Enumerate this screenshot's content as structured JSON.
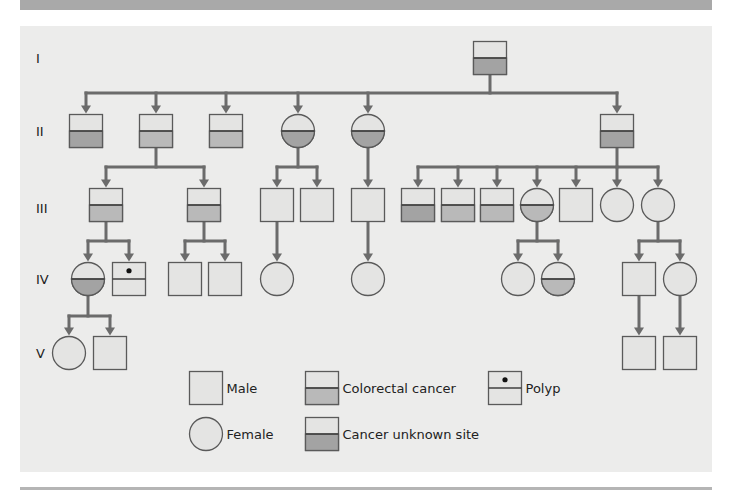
{
  "colors": {
    "background": "#ececeb",
    "node_fill": "#e4e4e3",
    "stroke": "#5a5a5a",
    "connector": "#6b6b6b",
    "colorectal_fill": "#b9b9b9",
    "unknown_site_fill": "#a3a3a3",
    "top_bar": "#a9a9a9"
  },
  "generations": [
    {
      "label": "I",
      "y": 58
    },
    {
      "label": "II",
      "y": 131
    },
    {
      "label": "III",
      "y": 208
    },
    {
      "label": "IV",
      "y": 279
    },
    {
      "label": "V",
      "y": 353
    }
  ],
  "nodes": [
    {
      "id": "g1-1",
      "gen": "I",
      "sex": "male",
      "status": "unknown_site",
      "cx": 490,
      "cy": 58
    },
    {
      "id": "g2-1",
      "gen": "II",
      "sex": "male",
      "status": "unknown_site",
      "cx": 86,
      "cy": 131
    },
    {
      "id": "g2-2",
      "gen": "II",
      "sex": "male",
      "status": "colorectal",
      "cx": 156,
      "cy": 131
    },
    {
      "id": "g2-3",
      "gen": "II",
      "sex": "male",
      "status": "colorectal",
      "cx": 226,
      "cy": 131
    },
    {
      "id": "g2-4",
      "gen": "II",
      "sex": "female",
      "status": "unknown_site",
      "cx": 298,
      "cy": 131
    },
    {
      "id": "g2-5",
      "gen": "II",
      "sex": "female",
      "status": "unknown_site",
      "cx": 368,
      "cy": 131
    },
    {
      "id": "g2-6",
      "gen": "II",
      "sex": "male",
      "status": "unknown_site",
      "cx": 617,
      "cy": 131
    },
    {
      "id": "g3-1",
      "gen": "III",
      "sex": "male",
      "status": "colorectal",
      "cx": 106,
      "cy": 205
    },
    {
      "id": "g3-2",
      "gen": "III",
      "sex": "male",
      "status": "colorectal",
      "cx": 204,
      "cy": 205
    },
    {
      "id": "g3-3",
      "gen": "III",
      "sex": "male",
      "status": "unaffected",
      "cx": 277,
      "cy": 205
    },
    {
      "id": "g3-4",
      "gen": "III",
      "sex": "male",
      "status": "unaffected",
      "cx": 317,
      "cy": 205
    },
    {
      "id": "g3-5",
      "gen": "III",
      "sex": "male",
      "status": "unaffected",
      "cx": 368,
      "cy": 205
    },
    {
      "id": "g3-6",
      "gen": "III",
      "sex": "male",
      "status": "unknown_site",
      "cx": 418,
      "cy": 205
    },
    {
      "id": "g3-7",
      "gen": "III",
      "sex": "male",
      "status": "colorectal",
      "cx": 458,
      "cy": 205
    },
    {
      "id": "g3-8",
      "gen": "III",
      "sex": "male",
      "status": "colorectal",
      "cx": 497,
      "cy": 205
    },
    {
      "id": "g3-9",
      "gen": "III",
      "sex": "female",
      "status": "colorectal",
      "cx": 537,
      "cy": 205
    },
    {
      "id": "g3-10",
      "gen": "III",
      "sex": "male",
      "status": "unaffected",
      "cx": 576,
      "cy": 205
    },
    {
      "id": "g3-11",
      "gen": "III",
      "sex": "female",
      "status": "unaffected",
      "cx": 617,
      "cy": 205
    },
    {
      "id": "g3-12",
      "gen": "III",
      "sex": "female",
      "status": "unaffected",
      "cx": 658,
      "cy": 205
    },
    {
      "id": "g4-1",
      "gen": "IV",
      "sex": "female",
      "status": "unknown_site",
      "cx": 88,
      "cy": 279
    },
    {
      "id": "g4-2",
      "gen": "IV",
      "sex": "male",
      "status": "polyp",
      "cx": 129,
      "cy": 279
    },
    {
      "id": "g4-3",
      "gen": "IV",
      "sex": "male",
      "status": "unaffected",
      "cx": 185,
      "cy": 279
    },
    {
      "id": "g4-4",
      "gen": "IV",
      "sex": "male",
      "status": "unaffected",
      "cx": 225,
      "cy": 279
    },
    {
      "id": "g4-5",
      "gen": "IV",
      "sex": "female",
      "status": "unaffected",
      "cx": 277,
      "cy": 279
    },
    {
      "id": "g4-6",
      "gen": "IV",
      "sex": "female",
      "status": "unaffected",
      "cx": 368,
      "cy": 279
    },
    {
      "id": "g4-7",
      "gen": "IV",
      "sex": "female",
      "status": "unaffected",
      "cx": 518,
      "cy": 279
    },
    {
      "id": "g4-8",
      "gen": "IV",
      "sex": "female",
      "status": "colorectal",
      "cx": 558,
      "cy": 279
    },
    {
      "id": "g4-9",
      "gen": "IV",
      "sex": "male",
      "status": "unaffected",
      "cx": 639,
      "cy": 279
    },
    {
      "id": "g4-10",
      "gen": "IV",
      "sex": "female",
      "status": "unaffected",
      "cx": 680,
      "cy": 279
    },
    {
      "id": "g5-1",
      "gen": "V",
      "sex": "female",
      "status": "unaffected",
      "cx": 69,
      "cy": 353
    },
    {
      "id": "g5-2",
      "gen": "V",
      "sex": "male",
      "status": "unaffected",
      "cx": 110,
      "cy": 353
    },
    {
      "id": "g5-3",
      "gen": "V",
      "sex": "male",
      "status": "unaffected",
      "cx": 639,
      "cy": 353
    },
    {
      "id": "g5-4",
      "gen": "V",
      "sex": "male",
      "status": "unaffected",
      "cx": 680,
      "cy": 353
    }
  ],
  "sibships": [
    {
      "parent": "g1-1",
      "bar_y": 93,
      "children": [
        "g2-1",
        "g2-2",
        "g2-3",
        "g2-4",
        "g2-5",
        "g2-6"
      ]
    },
    {
      "parent": "g2-2",
      "bar_y": 167,
      "children": [
        "g3-1",
        "g3-2"
      ]
    },
    {
      "parent": "g2-4",
      "bar_y": 167,
      "children": [
        "g3-3",
        "g3-4"
      ]
    },
    {
      "parent": "g2-5",
      "bar_y": null,
      "children": [
        "g3-5"
      ]
    },
    {
      "parent": "g2-6",
      "bar_y": 167,
      "children": [
        "g3-6",
        "g3-7",
        "g3-8",
        "g3-9",
        "g3-10",
        "g3-11",
        "g3-12"
      ]
    },
    {
      "parent": "g3-1",
      "bar_y": 241,
      "children": [
        "g4-1",
        "g4-2"
      ]
    },
    {
      "parent": "g3-2",
      "bar_y": 241,
      "children": [
        "g4-3",
        "g4-4"
      ]
    },
    {
      "parent": "g3-3",
      "bar_y": null,
      "children": [
        "g4-5"
      ]
    },
    {
      "parent": "g3-5",
      "bar_y": null,
      "children": [
        "g4-6"
      ]
    },
    {
      "parent": "g3-9",
      "bar_y": 241,
      "children": [
        "g4-7",
        "g4-8"
      ]
    },
    {
      "parent": "g3-12",
      "bar_y": 241,
      "children": [
        "g4-9",
        "g4-10"
      ]
    },
    {
      "parent": "g4-1",
      "bar_y": 316,
      "children": [
        "g5-1",
        "g5-2"
      ]
    },
    {
      "parent": "g4-9",
      "bar_y": null,
      "children": [
        "g5-3"
      ]
    },
    {
      "parent": "g4-10",
      "bar_y": null,
      "children": [
        "g5-4"
      ]
    }
  ],
  "legend": [
    {
      "symbol": "male",
      "status": "unaffected",
      "label": "Male",
      "cx": 206,
      "cy": 388
    },
    {
      "symbol": "female",
      "status": "unaffected",
      "label": "Female",
      "cx": 206,
      "cy": 434
    },
    {
      "symbol": "male",
      "status": "colorectal",
      "label": "Colorectal cancer",
      "cx": 322,
      "cy": 388
    },
    {
      "symbol": "male",
      "status": "unknown_site",
      "label": "Cancer unknown site",
      "cx": 322,
      "cy": 434
    },
    {
      "symbol": "male",
      "status": "polyp",
      "label": "Polyp",
      "cx": 505,
      "cy": 388
    }
  ]
}
